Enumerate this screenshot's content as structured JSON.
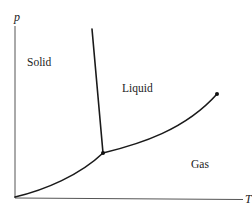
{
  "diagram": {
    "axes": {
      "y_label": "p",
      "x_label": "T"
    },
    "regions": {
      "solid": "Solid",
      "liquid": "Liquid",
      "gas": "Gas"
    },
    "colors": {
      "curve": "#1a1a1a",
      "axis": "#555555",
      "text": "#222222",
      "background": "#ffffff"
    },
    "curves": [
      {
        "name": "fusion-curve",
        "description": "solid-liquid boundary, steep negative slope",
        "from": [
          92,
          29
        ],
        "to": [
          103,
          153
        ]
      },
      {
        "name": "sublimation-curve",
        "description": "solid-gas boundary from origin to triple point",
        "from": [
          15,
          197
        ],
        "to": [
          103,
          153
        ]
      },
      {
        "name": "vaporization-curve",
        "description": "liquid-gas boundary from triple point to critical point",
        "from": [
          103,
          153
        ],
        "to": [
          217,
          94
        ]
      }
    ],
    "points": [
      {
        "name": "triple-point",
        "at": [
          103,
          153
        ]
      },
      {
        "name": "critical-point",
        "at": [
          217,
          94
        ]
      }
    ]
  }
}
